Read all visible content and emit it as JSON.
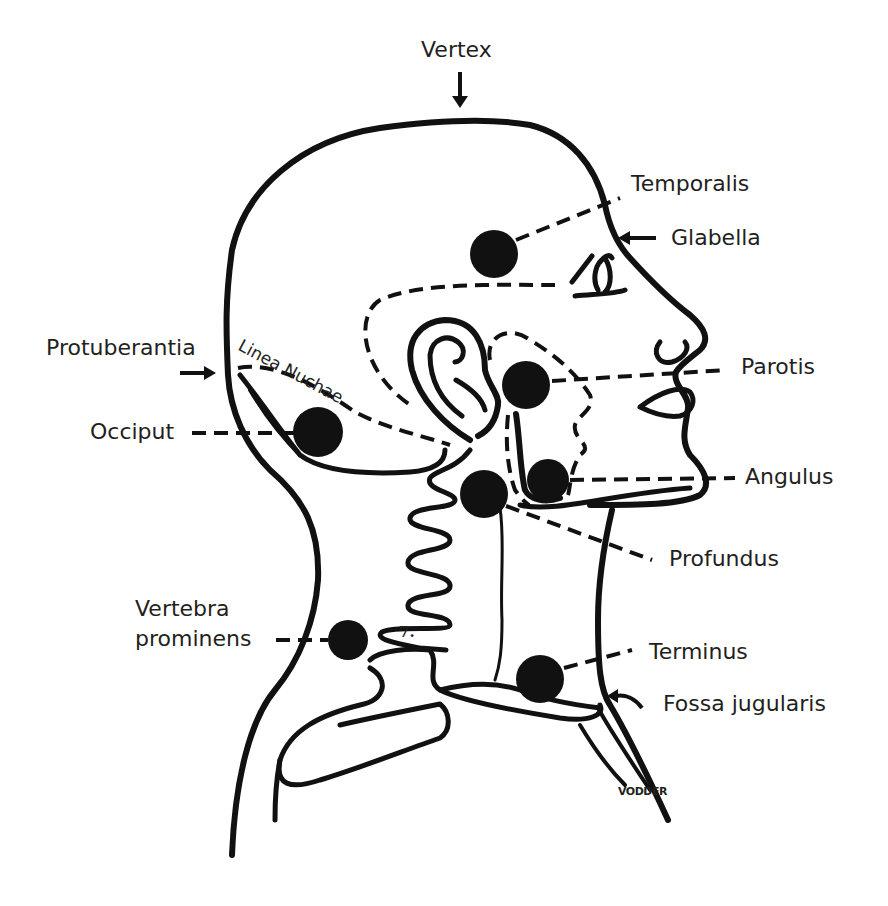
{
  "figure": {
    "signature": "VODDER",
    "vertebra_number": "7.",
    "ink_color": "#111111",
    "background": "#ffffff"
  },
  "labels": {
    "vertex": "Vertex",
    "temporalis": "Temporalis",
    "glabella": "Glabella",
    "protuberantia": "Protuberantia",
    "linea_nuchae": "Linea Nuchae",
    "parotis": "Parotis",
    "occiput": "Occiput",
    "angulus": "Angulus",
    "profundus": "Profundus",
    "vertebra_prominens_line1": "Vertebra",
    "vertebra_prominens_line2": "prominens",
    "terminus": "Terminus",
    "fossa_jugularis": "Fossa jugularis"
  },
  "points": [
    {
      "name": "Temporalis",
      "x": 494,
      "y": 254,
      "r": 24
    },
    {
      "name": "Parotis",
      "x": 526,
      "y": 385,
      "r": 24
    },
    {
      "name": "Occiput",
      "x": 318,
      "y": 432,
      "r": 25
    },
    {
      "name": "Angulus",
      "x": 548,
      "y": 480,
      "r": 21
    },
    {
      "name": "Profundus",
      "x": 484,
      "y": 494,
      "r": 24
    },
    {
      "name": "Vertebra prominens",
      "x": 348,
      "y": 640,
      "r": 20
    },
    {
      "name": "Terminus",
      "x": 540,
      "y": 679,
      "r": 24
    }
  ]
}
